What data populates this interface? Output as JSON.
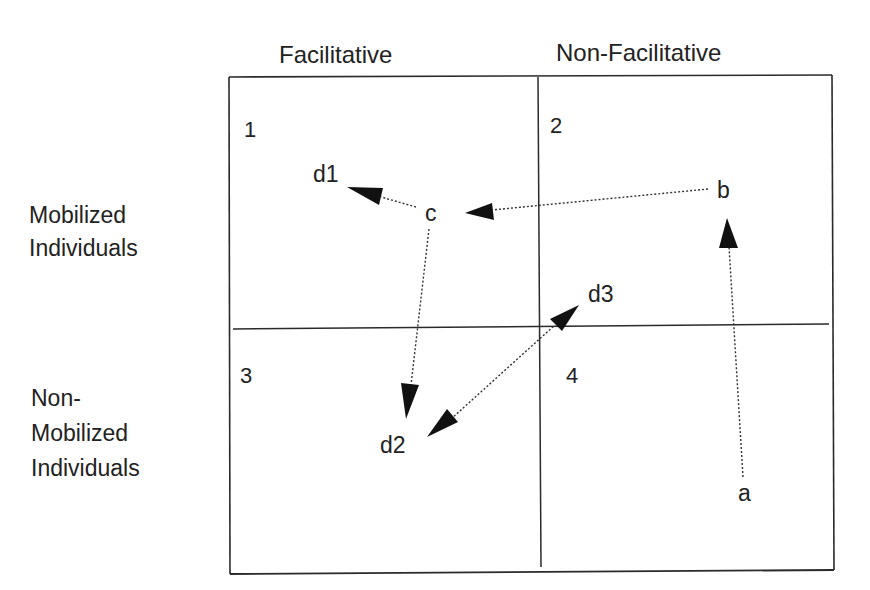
{
  "columns": {
    "left": "Facilitative",
    "right": "Non-Facilitative"
  },
  "rows": {
    "top": [
      "Mobilized",
      "Individuals"
    ],
    "bottom": [
      "Non-",
      "Mobilized",
      "Individuals"
    ]
  },
  "quadrants": [
    {
      "number": "1",
      "column": "Facilitative",
      "row": "Mobilized Individuals"
    },
    {
      "number": "2",
      "column": "Non-Facilitative",
      "row": "Mobilized Individuals"
    },
    {
      "number": "3",
      "column": "Facilitative",
      "row": "Non-Mobilized Individuals"
    },
    {
      "number": "4",
      "column": "Non-Facilitative",
      "row": "Non-Mobilized Individuals"
    }
  ],
  "points": {
    "a": {
      "label": "a",
      "quadrant": "4"
    },
    "b": {
      "label": "b",
      "quadrant": "2"
    },
    "c": {
      "label": "c",
      "quadrant": "1"
    },
    "d1": {
      "label": "d1",
      "quadrant": "1"
    },
    "d2": {
      "label": "d2",
      "quadrant": "3"
    },
    "d3": {
      "label": "d3",
      "quadrant": "2/4 boundary"
    }
  },
  "arrows": [
    {
      "from": "a",
      "to": "b",
      "style": "dotted",
      "direction": "single"
    },
    {
      "from": "b",
      "to": "c",
      "style": "dotted",
      "direction": "single"
    },
    {
      "from": "c",
      "to": "d1",
      "style": "dotted",
      "direction": "single"
    },
    {
      "from": "c",
      "to": "d2",
      "style": "dotted",
      "direction": "single"
    },
    {
      "from": "d2",
      "to": "d3",
      "style": "dotted",
      "direction": "double"
    }
  ],
  "colors": {
    "line": "#2a2a2a",
    "text": "#222222",
    "background": "#ffffff"
  }
}
